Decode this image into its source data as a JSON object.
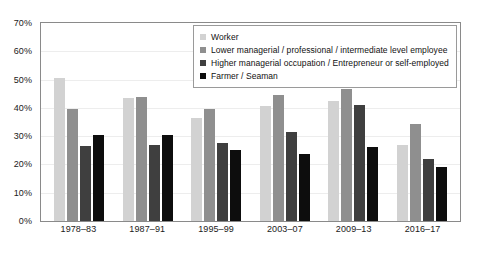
{
  "chart_data": {
    "type": "bar",
    "title": "",
    "xlabel": "",
    "ylabel": "",
    "ylim": [
      0,
      70
    ],
    "grid": true,
    "legend_position": "top-center-inside",
    "categories": [
      "1978–83",
      "1987–91",
      "1995–99",
      "2003–07",
      "2009–13",
      "2016–17"
    ],
    "ytick_labels": [
      "70%",
      "60%",
      "50%",
      "40%",
      "30%",
      "20%",
      "10%",
      "0%"
    ],
    "ytick_values": [
      70,
      60,
      50,
      40,
      30,
      20,
      10,
      0
    ],
    "series": [
      {
        "name": "Worker",
        "color": "#d2d2d2",
        "values": [
          50.5,
          43.5,
          36.5,
          40.5,
          42.5,
          26.8
        ]
      },
      {
        "name": "Lower managerial / professional / intermediate level employee",
        "color": "#8f8f8f",
        "values": [
          39.5,
          44.0,
          39.5,
          44.5,
          46.5,
          34.3
        ]
      },
      {
        "name": "Higher managerial occupation / Entrepreneur or self-employed",
        "color": "#3f3f3f",
        "values": [
          26.5,
          26.8,
          27.5,
          31.5,
          41.0,
          21.8
        ]
      },
      {
        "name": "Farmer / Seaman",
        "color": "#0d0d0d",
        "values": [
          30.5,
          30.5,
          25.0,
          23.8,
          26.0,
          19.0
        ]
      }
    ]
  }
}
